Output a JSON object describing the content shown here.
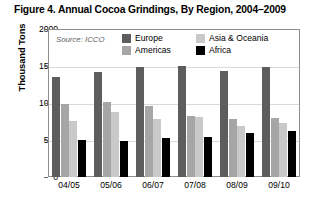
{
  "figure": {
    "title": "Figure 4. Annual Cocoa Grindings, By Region, 2004–2009",
    "source": "Source: ICCO"
  },
  "colors": {
    "europe": "#5d5d5d",
    "americas": "#a6a6a6",
    "asia": "#c9c9c9",
    "africa": "#000000",
    "frame": "#8f8f8f",
    "grid": "#d9d9d9",
    "background": "#ffffff"
  },
  "axes": {
    "y_title": "Thousand Tons",
    "y_ticks": [
      "2000",
      "1500",
      "1000",
      "500",
      "0"
    ],
    "x_ticks": [
      "04/05",
      "05/06",
      "06/07",
      "07/08",
      "08/09",
      "09/10"
    ]
  },
  "legend": {
    "entries": [
      {
        "label": "Europe",
        "key": "europe"
      },
      {
        "label": "Americas",
        "key": "americas"
      },
      {
        "label": "Asia & Oceania",
        "key": "asia"
      },
      {
        "label": "Africa",
        "key": "africa"
      }
    ]
  },
  "chart_data": {
    "type": "bar",
    "title": "Figure 4. Annual Cocoa Grindings, By Region, 2004–2009",
    "subtitle": "Source: ICCO",
    "xlabel": "",
    "ylabel": "Thousand Tons",
    "ylim": [
      0,
      2000
    ],
    "ytick_values": [
      0,
      500,
      1000,
      1500,
      2000
    ],
    "grid": true,
    "legend_position": "top-inside",
    "categories": [
      "04/05",
      "05/06",
      "06/07",
      "07/08",
      "08/09",
      "09/10"
    ],
    "series": [
      {
        "name": "Europe",
        "color": "#5d5d5d",
        "values": [
          1355,
          1420,
          1490,
          1500,
          1430,
          1490
        ]
      },
      {
        "name": "Americas",
        "color": "#a6a6a6",
        "values": [
          985,
          1010,
          955,
          820,
          790,
          800
        ]
      },
      {
        "name": "Asia & Oceania",
        "color": "#c9c9c9",
        "values": [
          760,
          880,
          790,
          810,
          690,
          725
        ]
      },
      {
        "name": "Africa",
        "color": "#000000",
        "values": [
          500,
          490,
          530,
          545,
          590,
          625
        ]
      }
    ]
  }
}
